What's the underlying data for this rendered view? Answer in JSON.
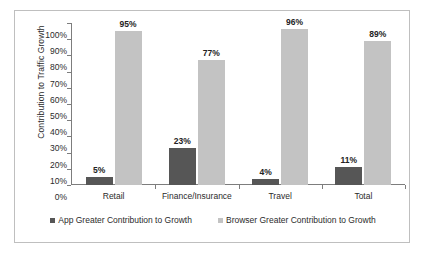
{
  "chart_data": {
    "type": "bar",
    "title": "",
    "subtitle": "",
    "xlabel": "",
    "ylabel": "Contribution to Traffic Growth",
    "ylim": [
      0,
      100
    ],
    "y_tick_labels": [
      "100%",
      "90%",
      "80%",
      "70%",
      "60%",
      "50%",
      "40%",
      "30%",
      "20%",
      "10%",
      "0%"
    ],
    "y_tick_values": [
      100,
      90,
      80,
      70,
      60,
      50,
      40,
      30,
      20,
      10,
      0
    ],
    "grid": false,
    "legend_position": "bottom",
    "categories": [
      "Retail",
      "Finance/Insurance",
      "Travel",
      "Total"
    ],
    "series": [
      {
        "name": "App Greater Contribution to Growth",
        "color": "#565656",
        "values": [
          5,
          23,
          4,
          11
        ],
        "labels": [
          "5%",
          "23%",
          "4%",
          "11%"
        ]
      },
      {
        "name": "Browser Greater Contribution to Growth",
        "color": "#c3c3c3",
        "values": [
          95,
          77,
          96,
          89
        ],
        "labels": [
          "95%",
          "77%",
          "96%",
          "89%"
        ]
      }
    ]
  },
  "legend": {
    "items": [
      {
        "label": "App Greater Contribution to Growth",
        "swatch": "app"
      },
      {
        "label": "Browser Greater Contribution to Growth",
        "swatch": "browser"
      }
    ]
  }
}
